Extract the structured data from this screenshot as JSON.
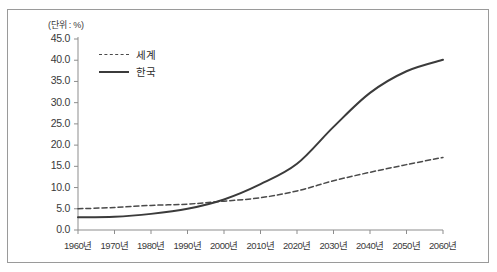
{
  "figure": {
    "unit_label": "(단위 : %)",
    "frame_color": "#9a9a9a",
    "background": "#ffffff"
  },
  "chart_data": {
    "type": "line",
    "title": "",
    "subtitle": "",
    "xlabel": "",
    "ylabel": "",
    "unit": "%",
    "unit_annotation": "(단위 : %)",
    "grid": false,
    "legend_position": "upper-left-inside",
    "x": [
      1960,
      1970,
      1980,
      1990,
      2000,
      2010,
      2020,
      2030,
      2040,
      2050,
      2060
    ],
    "categories": [
      "1960년",
      "1970년",
      "1980년",
      "1990년",
      "2000년",
      "2010년",
      "2020년",
      "2030년",
      "2040년",
      "2050년",
      "2060년"
    ],
    "xlim": [
      1960,
      2060
    ],
    "ylim": [
      0.0,
      45.0
    ],
    "ytick_labels": [
      "45.0",
      "40.0",
      "35.0",
      "30.0",
      "25.0",
      "20.0",
      "15.0",
      "10.0",
      "5.0",
      "0.0"
    ],
    "ytick_values": [
      45.0,
      40.0,
      35.0,
      30.0,
      25.0,
      20.0,
      15.0,
      10.0,
      5.0,
      0.0
    ],
    "ytick_step": 5.0,
    "series": [
      {
        "name": "세계",
        "style": "dashed",
        "color": "#4a4a4a",
        "values": [
          5.0,
          5.3,
          5.8,
          6.1,
          6.8,
          7.6,
          9.2,
          11.6,
          13.6,
          15.4,
          17.1
        ]
      },
      {
        "name": "한국",
        "style": "solid",
        "color": "#3b3b3b",
        "values": [
          3.0,
          3.1,
          3.8,
          5.0,
          7.2,
          10.8,
          15.6,
          24.3,
          32.3,
          37.4,
          40.1
        ]
      }
    ]
  },
  "legend": {
    "items": [
      {
        "label": "세계",
        "style": "dashed"
      },
      {
        "label": "한국",
        "style": "solid"
      }
    ]
  }
}
